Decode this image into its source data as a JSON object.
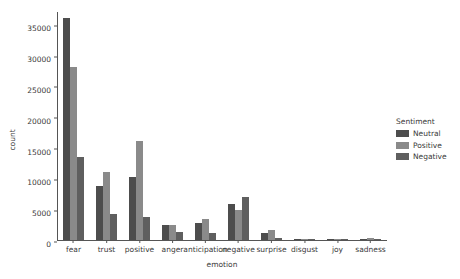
{
  "chart_data": {
    "type": "bar",
    "title": "",
    "xlabel": "emotion",
    "ylabel": "count",
    "categories": [
      "fear",
      "trust",
      "positive",
      "anger",
      "anticipation",
      "negative",
      "surprise",
      "disgust",
      "joy",
      "sadness"
    ],
    "series": [
      {
        "name": "Neutral",
        "color": "#4d4d4d",
        "values": [
          36000,
          8800,
          10300,
          2400,
          2800,
          5800,
          1200,
          200,
          150,
          150
        ]
      },
      {
        "name": "Positive",
        "color": "#8a8a8a",
        "values": [
          28000,
          11000,
          16000,
          2500,
          3400,
          4900,
          1600,
          200,
          150,
          300
        ]
      },
      {
        "name": "Negative",
        "color": "#5f5f5f",
        "values": [
          13500,
          4200,
          3700,
          1300,
          1200,
          6900,
          400,
          150,
          100,
          150
        ]
      }
    ],
    "ylim": [
      0,
      37000
    ],
    "yticks": [
      0,
      5000,
      10000,
      15000,
      20000,
      25000,
      30000,
      35000
    ],
    "ytick_labels": [
      "0",
      "5000",
      "10000",
      "15000",
      "20000",
      "25000",
      "30000",
      "35000"
    ],
    "grid": false,
    "legend_position": "right",
    "legend": {
      "title": "Sentiment",
      "entries": [
        "Neutral",
        "Positive",
        "Negative"
      ]
    }
  }
}
